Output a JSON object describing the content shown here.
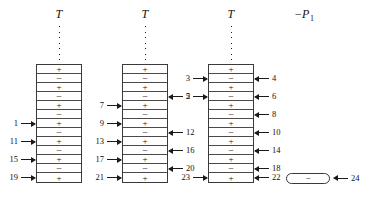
{
  "figure": {
    "sign_plus": "+",
    "sign_minus": "−"
  },
  "columns": [
    {
      "id": "column-1",
      "header": "T",
      "dot_count": 7,
      "cells": [
        "+",
        "−",
        "+",
        "−",
        "+",
        "−",
        "+",
        "−",
        "+",
        "−",
        "+",
        "−",
        "+"
      ],
      "left_labels": [
        {
          "row": 7,
          "text": "1"
        },
        {
          "row": 9,
          "text": "11"
        },
        {
          "row": 11,
          "text": "15"
        },
        {
          "row": 13,
          "text": "19"
        }
      ],
      "right_labels": []
    },
    {
      "id": "column-2",
      "header": "T",
      "dot_count": 7,
      "cells": [
        "+",
        "−",
        "+",
        "−",
        "+",
        "−",
        "+",
        "−",
        "+",
        "−",
        "+",
        "−",
        "+"
      ],
      "left_labels": [
        {
          "row": 5,
          "text": "7"
        },
        {
          "row": 7,
          "text": "9"
        },
        {
          "row": 9,
          "text": "13"
        },
        {
          "row": 11,
          "text": "17"
        },
        {
          "row": 13,
          "text": "21"
        }
      ],
      "right_labels": [
        {
          "row": 4,
          "text": "2"
        },
        {
          "row": 8,
          "text": "12"
        },
        {
          "row": 10,
          "text": "16"
        },
        {
          "row": 12,
          "text": "20"
        }
      ]
    },
    {
      "id": "column-3",
      "header": "T",
      "dot_count": 7,
      "cells": [
        "+",
        "−",
        "+",
        "−",
        "+",
        "−",
        "+",
        "−",
        "+",
        "−",
        "+",
        "−",
        "+"
      ],
      "left_labels": [
        {
          "row": 2,
          "text": "3"
        },
        {
          "row": 4,
          "text": "5"
        },
        {
          "row": 13,
          "text": "23"
        }
      ],
      "right_labels": [
        {
          "row": 2,
          "text": "4"
        },
        {
          "row": 4,
          "text": "6"
        },
        {
          "row": 6,
          "text": "8"
        },
        {
          "row": 8,
          "text": "10"
        },
        {
          "row": 10,
          "text": "14"
        },
        {
          "row": 12,
          "text": "18"
        },
        {
          "row": 13,
          "text": "22"
        }
      ]
    }
  ],
  "right_section": {
    "p1_label_main": "−P",
    "p1_label_sub": "1",
    "pill_sign": "−",
    "pill_label": "24"
  }
}
